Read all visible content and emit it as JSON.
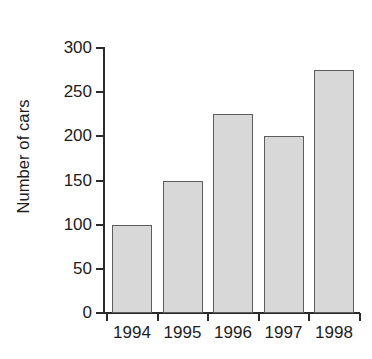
{
  "chart_data": {
    "type": "bar",
    "title": "",
    "subtitle": "",
    "xlabel": "",
    "ylabel": "Number of cars",
    "categories": [
      "1994",
      "1995",
      "1996",
      "1997",
      "1998"
    ],
    "values": [
      100,
      150,
      225,
      200,
      275
    ],
    "series": [
      {
        "name": "Number of cars",
        "values": [
          100,
          150,
          225,
          200,
          275
        ]
      }
    ],
    "ylim": [
      0,
      300
    ],
    "y_ticks": [
      0,
      50,
      100,
      150,
      200,
      250,
      300
    ],
    "y_tick_labels": [
      "0",
      "50",
      "100",
      "150",
      "200",
      "250",
      "300"
    ],
    "grid": false,
    "legend": false,
    "legend_position": "none",
    "annotations": [],
    "colors": {
      "bar_fill": "#d8d8d8",
      "bar_border": "#5d5d5d",
      "axis": "#2b2b2b",
      "text": "#1c1c1c",
      "background": "#ffffff"
    }
  }
}
